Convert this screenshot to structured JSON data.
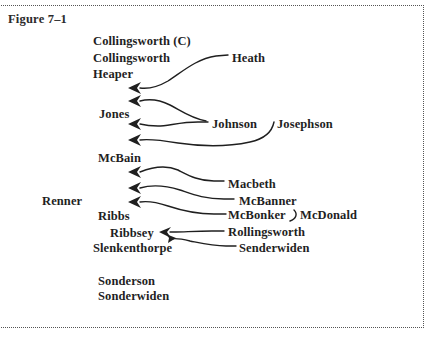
{
  "figure": {
    "label": "Figure 7–1",
    "border_style": "dotted",
    "border_color": "#555555",
    "background_color": "#ffffff",
    "text_color": "#1f1f1f",
    "width": 435,
    "height": 343
  },
  "diagram": {
    "type": "name-matching-cluster-diagram",
    "nodes": [
      {
        "id": "collingsworth_c",
        "label": "Collingsworth (C)",
        "x": 93,
        "y": 41,
        "role": "cluster-head"
      },
      {
        "id": "collingsworth",
        "label": "Collingsworth",
        "x": 93,
        "y": 58,
        "role": "member"
      },
      {
        "id": "heaper",
        "label": "Heaper",
        "x": 93,
        "y": 74,
        "role": "member"
      },
      {
        "id": "heath",
        "label": "Heath",
        "x": 232,
        "y": 58,
        "role": "source"
      },
      {
        "id": "jones",
        "label": "Jones",
        "x": 99,
        "y": 114,
        "role": "member"
      },
      {
        "id": "johnson",
        "label": "Johnson",
        "x": 212,
        "y": 124,
        "role": "source"
      },
      {
        "id": "josephson",
        "label": "Josephson",
        "x": 277,
        "y": 124,
        "role": "source"
      },
      {
        "id": "mcbain",
        "label": "McBain",
        "x": 98,
        "y": 158,
        "role": "member"
      },
      {
        "id": "renner",
        "label": "Renner",
        "x": 42,
        "y": 201,
        "role": "member"
      },
      {
        "id": "macbeth",
        "label": "Macbeth",
        "x": 228,
        "y": 184,
        "role": "source"
      },
      {
        "id": "mcbanner",
        "label": "McBanner",
        "x": 239,
        "y": 201,
        "role": "source"
      },
      {
        "id": "ribbs",
        "label": "Ribbs",
        "x": 98,
        "y": 216,
        "role": "member"
      },
      {
        "id": "mcbonker",
        "label": "McBonker",
        "x": 228,
        "y": 215,
        "role": "source"
      },
      {
        "id": "mcdonald",
        "label": "McDonald",
        "x": 300,
        "y": 215,
        "role": "source"
      },
      {
        "id": "ribbsey",
        "label": "Ribbsey",
        "x": 110,
        "y": 233,
        "role": "member"
      },
      {
        "id": "rollingsworth",
        "label": "Rollingsworth",
        "x": 228,
        "y": 232,
        "role": "source"
      },
      {
        "id": "slenkenthorpe",
        "label": "Slenkenthorpe",
        "x": 93,
        "y": 248,
        "role": "member"
      },
      {
        "id": "senderwiden",
        "label": "Senderwiden",
        "x": 239,
        "y": 248,
        "role": "source"
      },
      {
        "id": "sonderson",
        "label": "Sonderson",
        "x": 98,
        "y": 281,
        "role": "member"
      },
      {
        "id": "sonderwiden",
        "label": "Sonderwiden",
        "x": 98,
        "y": 296,
        "role": "member"
      }
    ],
    "links": [
      {
        "id": "heath-to-heaper",
        "from": "heath",
        "to": "heaper",
        "arrow": "left"
      },
      {
        "id": "johnson-up-to-jones",
        "from": "johnson",
        "to": "jones",
        "arrow": "left"
      },
      {
        "id": "johnson-to-jones",
        "from": "johnson",
        "to": "jones",
        "arrow": "left"
      },
      {
        "id": "josephson-to-jones",
        "from": "josephson",
        "to": "jones",
        "arrow": "left"
      },
      {
        "id": "macbeth-to-mcbain",
        "from": "macbeth",
        "to": "mcbain",
        "arrow": "left"
      },
      {
        "id": "mcbanner-to-mcbain",
        "from": "mcbanner",
        "to": "mcbain",
        "arrow": "left"
      },
      {
        "id": "mcbonker-to-mcbain",
        "from": "mcbonker",
        "to": "mcbain",
        "arrow": "left"
      },
      {
        "id": "mcdonald-to-mcbonker",
        "from": "mcdonald",
        "to": "mcbonker",
        "arrow": "none"
      },
      {
        "id": "rollingsworth-to-ribbsey",
        "from": "rollingsworth",
        "to": "ribbsey",
        "arrow": "left"
      },
      {
        "id": "senderwiden-to-slenkenthorpe",
        "from": "senderwiden",
        "to": "slenkenthorpe",
        "arrow": "down-left"
      }
    ]
  }
}
